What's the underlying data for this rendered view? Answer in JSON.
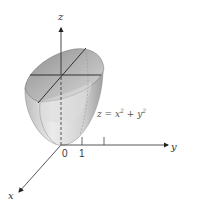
{
  "diagram": {
    "axes": {
      "x_label": "x",
      "y_label": "y",
      "z_label": "z"
    },
    "ticks": {
      "origin": "0",
      "y_one": "1"
    },
    "equation": {
      "lhs": "z = x",
      "sup1": "2",
      "mid": " + y",
      "sup2": "2"
    },
    "colors": {
      "axis": "#333333",
      "surface_light": "#e6e6e6",
      "surface_dark": "#9a9a9a",
      "inner_dark": "#a8a8a8"
    }
  }
}
